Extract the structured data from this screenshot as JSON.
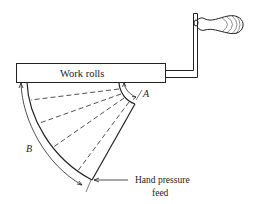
{
  "diagram": {
    "labels": {
      "work_rolls": "Work rolls",
      "angle_a": "A",
      "arc_b": "B",
      "feed_line1": "Hand pressure",
      "feed_line2": "feed"
    },
    "colors": {
      "stroke": "#222222",
      "background": "#ffffff"
    }
  }
}
